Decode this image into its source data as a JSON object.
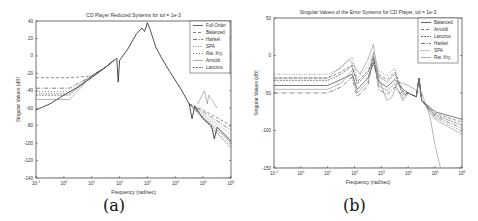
{
  "captions": {
    "a": "(a)",
    "b": "(b)"
  },
  "chart_data": [
    {
      "type": "line",
      "title": "CD Player Reduced Systems for tol = 1e-3",
      "xlabel": "Frequency (rad/sec)",
      "ylabel": "Singular Values (dB)",
      "xscale": "log",
      "xlim": [
        0.1,
        1000000
      ],
      "ylim": [
        -140,
        40
      ],
      "xticks": [
        "10^-1",
        "10^0",
        "10^1",
        "10^2",
        "10^3",
        "10^4",
        "10^5",
        "10^6"
      ],
      "yticks": [
        40,
        20,
        0,
        -20,
        -40,
        -60,
        -80,
        -100,
        -120,
        -140
      ],
      "legend_position": "upper right",
      "series": [
        {
          "name": "Full Order",
          "style": "solid"
        },
        {
          "name": "Balanced",
          "style": "dashed"
        },
        {
          "name": "Hankel",
          "style": "dashdot"
        },
        {
          "name": "SPA",
          "style": "dotted"
        },
        {
          "name": "Rat. Kry.",
          "style": "plus"
        },
        {
          "name": "Arnoldi",
          "style": "solid-light"
        },
        {
          "name": "Lanczos",
          "style": "cross"
        }
      ],
      "peak": {
        "x": 1000,
        "y": 38
      }
    },
    {
      "type": "line",
      "title": "Singular Values of the Error Systems for CD Player, tol = 1e-3",
      "xlabel": "Frequency (rad/sec)",
      "ylabel": "Singular Values (dB)",
      "xscale": "log",
      "xlim": [
        0.1,
        1000000
      ],
      "ylim": [
        -150,
        50
      ],
      "xticks": [
        "10^-1",
        "10^0",
        "10^1",
        "10^2",
        "10^3",
        "10^4",
        "10^5",
        "10^6"
      ],
      "yticks": [
        50,
        0,
        -50,
        -100,
        -150
      ],
      "legend_position": "upper right",
      "series": [
        {
          "name": "Balanced",
          "style": "solid"
        },
        {
          "name": "Arnoldi",
          "style": "dashed"
        },
        {
          "name": "Lanczos",
          "style": "cross"
        },
        {
          "name": "Hankel",
          "style": "dashdot"
        },
        {
          "name": "SPA",
          "style": "dotted"
        },
        {
          "name": "Rat. Kry.",
          "style": "solid-light"
        }
      ]
    }
  ]
}
